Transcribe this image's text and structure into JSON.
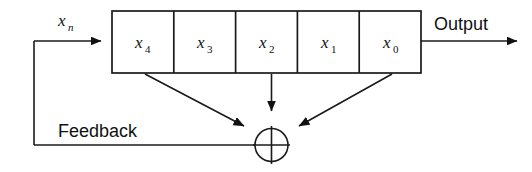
{
  "diagram": {
    "type": "lfsr-shift-register",
    "title_visible": false,
    "colors": {
      "stroke": "#1a1a1a",
      "text": "#111111",
      "background": "#ffffff"
    },
    "register": {
      "label": "shift-register",
      "cells": [
        {
          "id": "x4",
          "base": "x",
          "subscript": "4"
        },
        {
          "id": "x3",
          "base": "x",
          "subscript": "3"
        },
        {
          "id": "x2",
          "base": "x",
          "subscript": "2"
        },
        {
          "id": "x1",
          "base": "x",
          "subscript": "1"
        },
        {
          "id": "x0",
          "base": "x",
          "subscript": "0"
        }
      ]
    },
    "labels": {
      "input": {
        "base": "x",
        "subscript": "n"
      },
      "output": "Output",
      "feedback": "Feedback"
    },
    "xor": {
      "name": "xor-gate",
      "symbol": "+",
      "inputs": [
        "x4",
        "x2",
        "x0"
      ],
      "output_to": "feedback-line"
    },
    "taps": [
      {
        "from": "x4",
        "to": "xor-gate"
      },
      {
        "from": "x2",
        "to": "xor-gate"
      },
      {
        "from": "x0",
        "to": "xor-gate"
      }
    ]
  }
}
